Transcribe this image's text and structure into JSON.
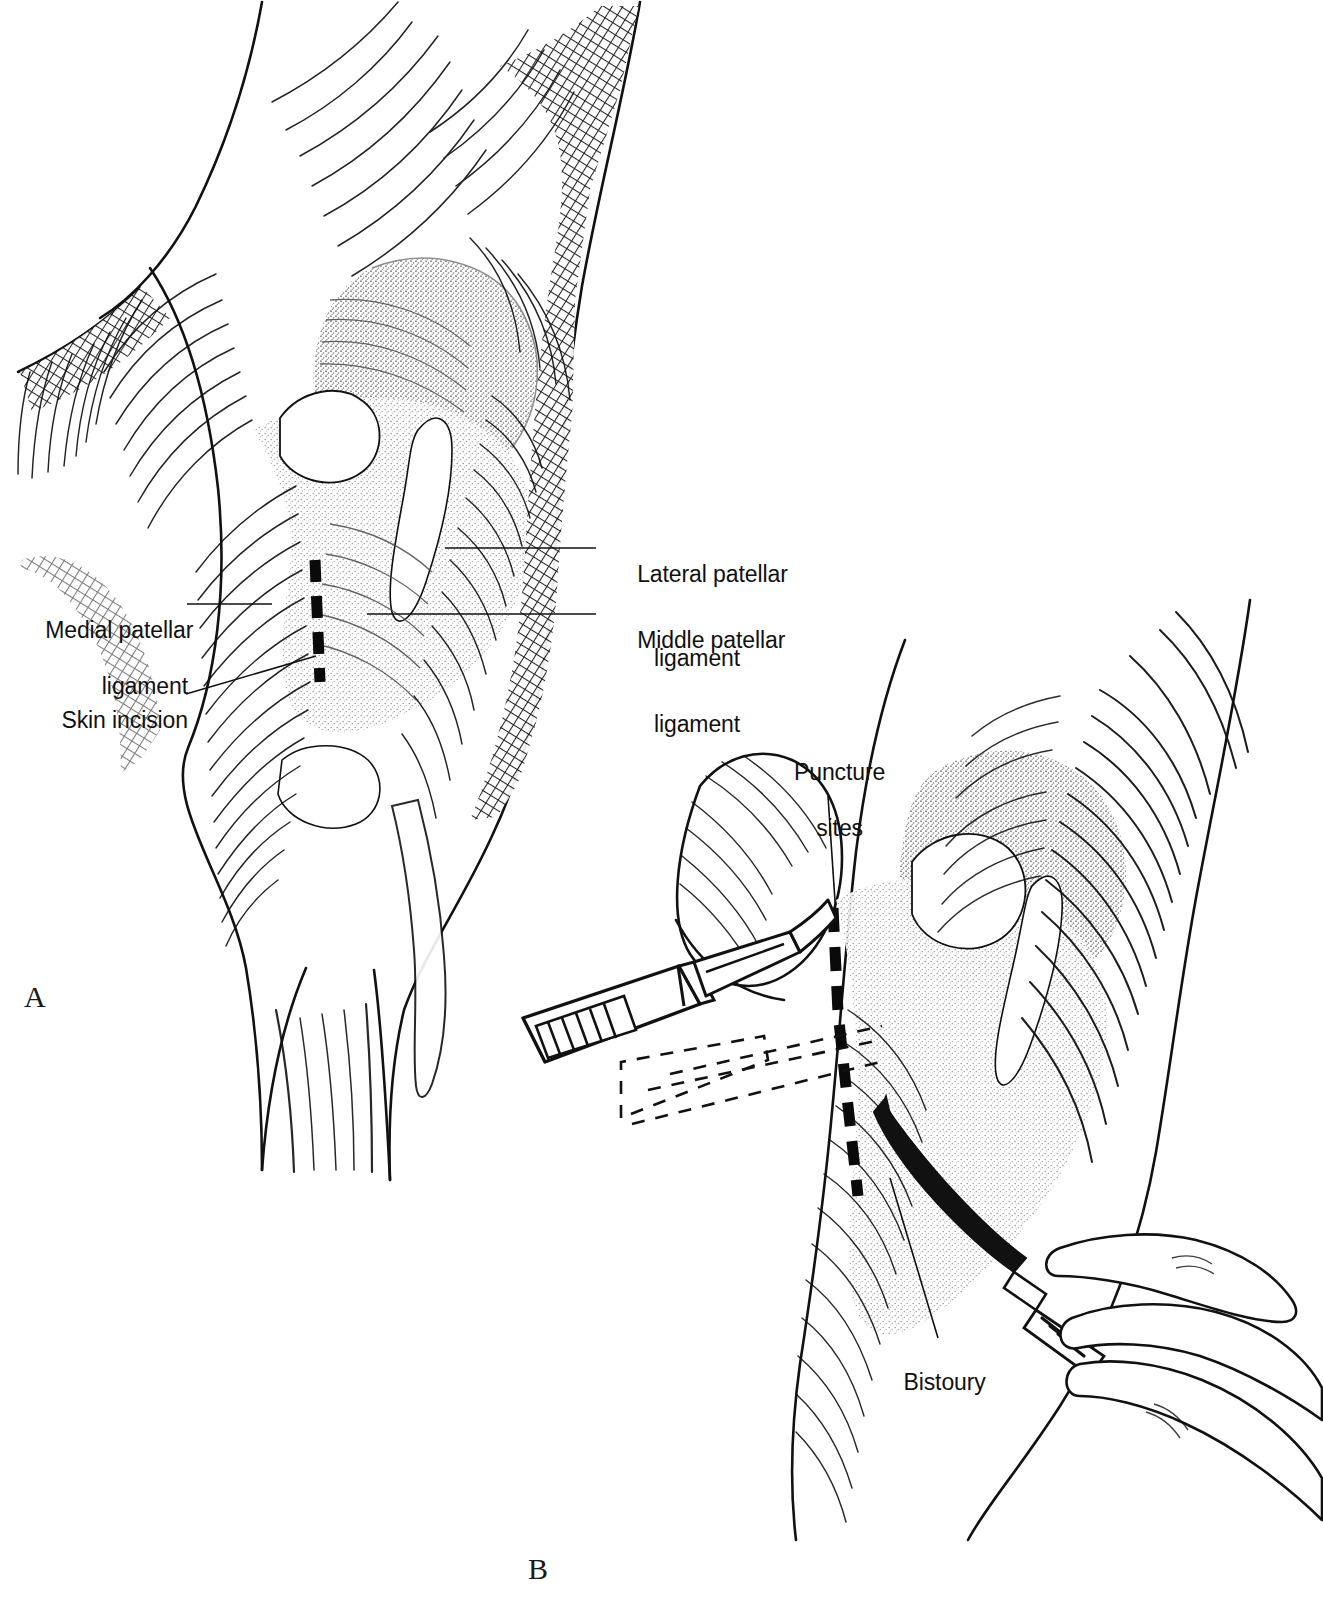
{
  "figure": {
    "type": "line-art medical illustration",
    "background_color": "#ffffff",
    "ink_color": "#111111",
    "stipple_color": "#9a9a9a"
  },
  "panels": [
    {
      "id": "A",
      "letter": "A",
      "caption": "Lateral view of the stifle showing the three patellar ligaments and the planned skin incision",
      "labels": [
        {
          "name": "medial-patellar-ligament",
          "line1": "Medial patellar",
          "line2": "ligament",
          "align": "right"
        },
        {
          "name": "skin-incision",
          "line1": "Skin incision",
          "line2": "",
          "align": "right"
        },
        {
          "name": "lateral-patellar-ligament",
          "line1": "Lateral patellar",
          "line2": "ligament",
          "align": "left"
        },
        {
          "name": "middle-patellar-ligament",
          "line1": "Middle patellar",
          "line2": "ligament",
          "align": "left"
        }
      ]
    },
    {
      "id": "B",
      "letter": "B",
      "caption": "Scalpel makes stab punctures; curved bistoury extends the incision",
      "labels": [
        {
          "name": "puncture-sites",
          "line1": "Puncture",
          "line2": "sites",
          "align": "center"
        },
        {
          "name": "bistoury",
          "line1": "Bistoury",
          "line2": "",
          "align": "center"
        }
      ],
      "instruments": [
        {
          "name": "scalpel",
          "label": ""
        },
        {
          "name": "bistoury-knife",
          "label": "Bistoury"
        },
        {
          "name": "surgeon-hand",
          "label": ""
        }
      ]
    }
  ],
  "text": {
    "medial_patellar_l1": "Medial patellar",
    "medial_patellar_l2": "ligament",
    "skin_incision": "Skin incision",
    "lateral_patellar_l1": "Lateral patellar",
    "lateral_patellar_l2": "ligament",
    "middle_patellar_l1": "Middle patellar",
    "middle_patellar_l2": "ligament",
    "puncture_l1": "Puncture",
    "puncture_l2": "sites",
    "bistoury": "Bistoury",
    "panel_a": "A",
    "panel_b": "B"
  }
}
